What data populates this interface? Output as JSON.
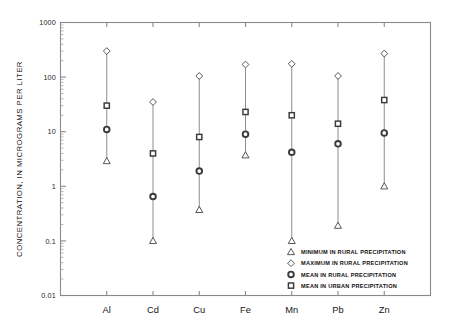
{
  "chart_data": {
    "type": "scatter",
    "title": "",
    "xlabel": "",
    "ylabel": "CONCENTRATION, IN MICROGRAMS PER LITER",
    "yscale": "log",
    "ylim": [
      0.01,
      1000
    ],
    "ytick_labels": [
      "1000",
      "100",
      "10",
      "1",
      "0.1",
      "0.01"
    ],
    "ytick_values": [
      1000,
      100,
      10,
      1,
      0.1,
      0.01
    ],
    "grid": false,
    "legend_position": "inside-bottom-right",
    "categories": [
      "Al",
      "Cd",
      "Cu",
      "Fe",
      "Mn",
      "Pb",
      "Zn"
    ],
    "series": [
      {
        "name": "MINIMUM IN RURAL PRECIPITATION",
        "marker": "triangle",
        "values": [
          2.9,
          0.1,
          0.37,
          3.7,
          0.1,
          0.19,
          1.0
        ]
      },
      {
        "name": "MAXIMUM IN RURAL PRECIPITATION",
        "marker": "diamond",
        "values": [
          300,
          35,
          105,
          170,
          175,
          105,
          270
        ]
      },
      {
        "name": "MEAN IN RURAL PRECIPITATION",
        "marker": "circle",
        "values": [
          11,
          0.65,
          1.9,
          9.0,
          4.2,
          6.0,
          9.5
        ]
      },
      {
        "name": "MEAN IN URBAN PRECIPITATION",
        "marker": "square",
        "values": [
          30,
          4.0,
          8.0,
          23,
          20,
          14,
          38
        ]
      }
    ]
  },
  "legend": {
    "entries": [
      {
        "marker": "triangle",
        "label": "MINIMUM IN RURAL  PRECIPITATION"
      },
      {
        "marker": "diamond",
        "label": "MAXIMUM IN RURAL  PRECIPITATION"
      },
      {
        "marker": "circle",
        "label": "MEAN IN RURAL  PRECIPITATION"
      },
      {
        "marker": "square",
        "label": "MEAN IN URBAN  PRECIPITATION"
      }
    ]
  },
  "colors": {
    "axis": "#8a8a8a",
    "marker_stroke": "#3a3a3a",
    "series_line": "#8d8d8d",
    "text": "#141414",
    "background": "#ffffff"
  }
}
